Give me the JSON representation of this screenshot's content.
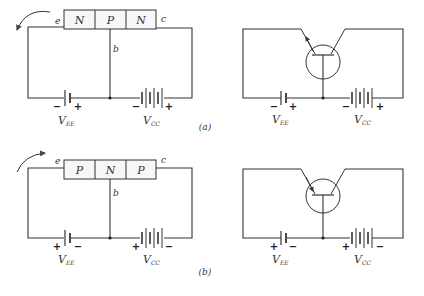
{
  "figure": {
    "panels": [
      {
        "id": "a",
        "caption": "(a)",
        "type": "NPN",
        "block": {
          "regions": [
            "N",
            "P",
            "N"
          ],
          "terminals": {
            "emitter": "e",
            "base": "b",
            "collector": "c"
          }
        },
        "sources": {
          "emitter_supply": {
            "label": "V",
            "subscript": "EE",
            "left_sign": "−",
            "right_sign": "+"
          },
          "collector_supply": {
            "label": "V",
            "subscript": "CC",
            "left_sign": "−",
            "right_sign": "+"
          }
        },
        "current_arrow": "counterclockwise-out-of-emitter",
        "symbol_emitter_arrow": "outward"
      },
      {
        "id": "b",
        "caption": "(b)",
        "type": "PNP",
        "block": {
          "regions": [
            "P",
            "N",
            "P"
          ],
          "terminals": {
            "emitter": "e",
            "base": "b",
            "collector": "c"
          }
        },
        "sources": {
          "emitter_supply": {
            "label": "V",
            "subscript": "EE",
            "left_sign": "+",
            "right_sign": "−"
          },
          "collector_supply": {
            "label": "V",
            "subscript": "CC",
            "left_sign": "+",
            "right_sign": "−"
          }
        },
        "current_arrow": "clockwise-into-emitter",
        "symbol_emitter_arrow": "inward"
      }
    ]
  },
  "colors": {
    "ink": "#333333",
    "background": "#ffffff",
    "box_fill": "#f7f7f7"
  }
}
